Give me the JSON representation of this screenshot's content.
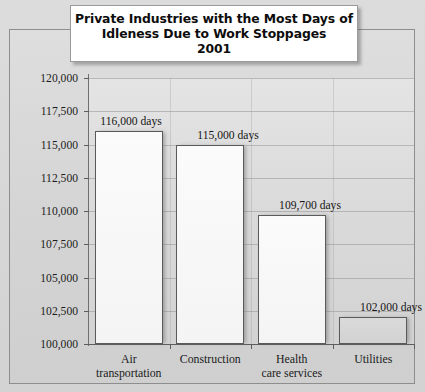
{
  "title": {
    "lines": [
      "Private Industries with the Most Days of",
      "Idleness Due to Work Stoppages",
      "2001"
    ]
  },
  "chart_data": {
    "type": "bar",
    "title": "Private Industries with the Most Days of Idleness Due to Work Stoppages 2001",
    "categories": [
      "Air transportation",
      "Construction",
      "Health care services",
      "Utilities"
    ],
    "category_lines": [
      [
        "Air",
        "transportation"
      ],
      [
        "Construction",
        ""
      ],
      [
        "Health",
        "care services"
      ],
      [
        "Utilities",
        ""
      ]
    ],
    "values": [
      116000,
      115000,
      109700,
      102000
    ],
    "data_labels": [
      "116,000 days",
      "115,000 days",
      "109,700 days",
      "102,000 days"
    ],
    "xlabel": "",
    "ylabel": "",
    "ylim": [
      100000,
      120000
    ],
    "ytick_values": [
      120000,
      117500,
      115000,
      112500,
      110000,
      107500,
      105000,
      102500,
      100000
    ],
    "ytick_labels": [
      "120,000",
      "117,500",
      "115,000",
      "112,500",
      "110,000",
      "107,500",
      "105,000",
      "102,500",
      "100,000"
    ],
    "grid": true,
    "legend": false,
    "colors": {
      "bar_fill": "#fbfbfb",
      "bar_fill_shaded": "#d8d8d8",
      "bar_border": "#5a5a5a",
      "plot_background": "#dadada",
      "panel_background": "#d6d6d6",
      "title_background": "#ffffff",
      "text": "#161616"
    }
  }
}
